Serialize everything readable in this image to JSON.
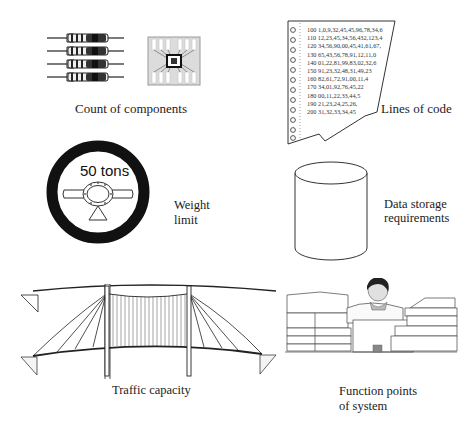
{
  "panels": {
    "components": {
      "label": "Count of components",
      "resistor_count": 4
    },
    "code": {
      "label": "Lines of code",
      "lines": [
        {
          "num": "100",
          "text": "1,0,9,32,45,45,96,78,34,6"
        },
        {
          "num": "110",
          "text": "12,23,45,34,56,432,123,4"
        },
        {
          "num": "120",
          "text": "34,56,90,00,45,41,61,67,"
        },
        {
          "num": "130",
          "text": "65,43,56,78,91,12,11,0"
        },
        {
          "num": "140",
          "text": "01,22,81,99,83,02,32,6"
        },
        {
          "num": "150",
          "text": "91,23,32,48,31,49,23"
        },
        {
          "num": "160",
          "text": "82,61,72,91,00,11,4"
        },
        {
          "num": "170",
          "text": "34,01,92,76,45,22"
        },
        {
          "num": "180",
          "text": "00,11,22,33,44,5"
        },
        {
          "num": "190",
          "text": "21,23,24,25,26,"
        },
        {
          "num": "200",
          "text": "31,32,33,34,45"
        }
      ]
    },
    "weight": {
      "sign_text": "50 tons",
      "label_line1": "Weight",
      "label_line2": "limit"
    },
    "storage": {
      "label_line1": "Data storage",
      "label_line2": "requirements"
    },
    "traffic": {
      "label": "Traffic capacity"
    },
    "function_points": {
      "label_line1": "Function points",
      "label_line2": "of system"
    }
  }
}
